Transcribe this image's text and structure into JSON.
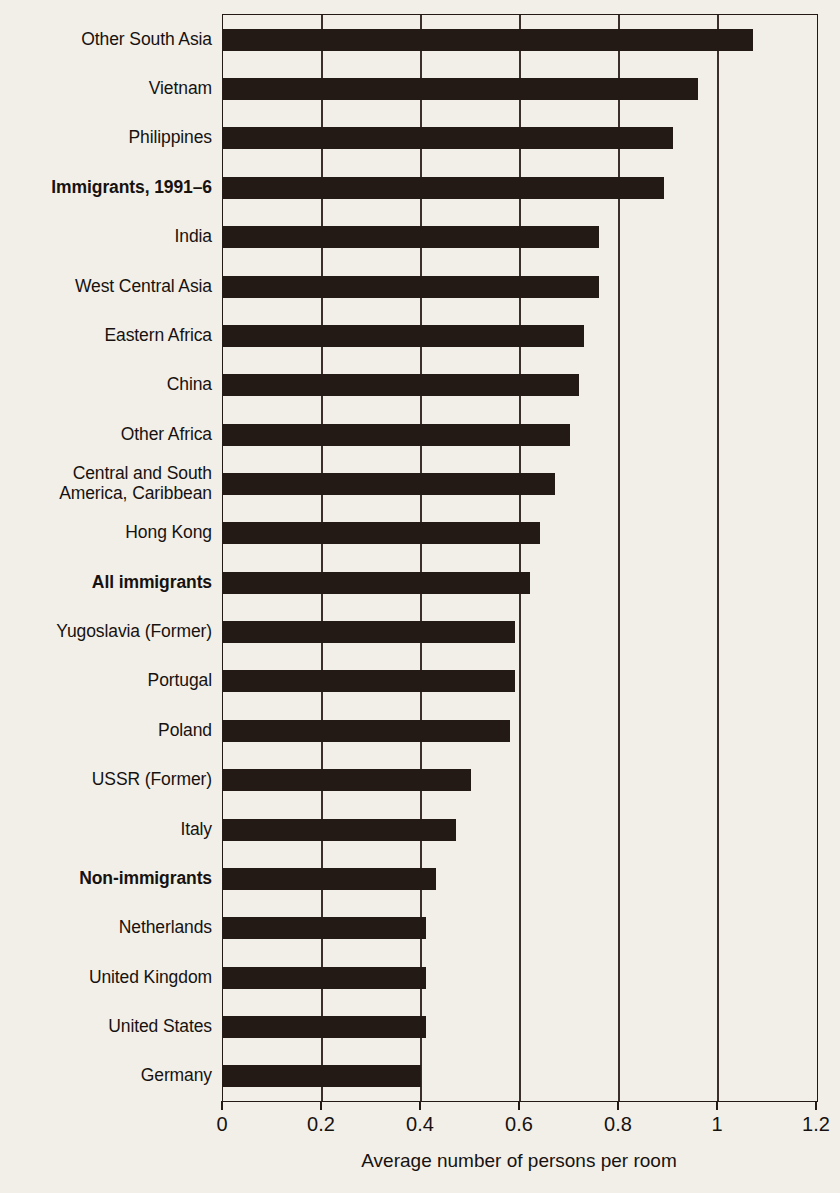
{
  "chart_data": {
    "type": "bar",
    "orientation": "horizontal",
    "title": "",
    "xlabel": "Average number of persons per room",
    "ylabel": "",
    "xlim": [
      0,
      1.2
    ],
    "xticks": [
      "0",
      "0.2",
      "0.4",
      "0.6",
      "0.8",
      "1",
      "1.2"
    ],
    "xtick_values": [
      0,
      0.2,
      0.4,
      0.6,
      0.8,
      1.0,
      1.2
    ],
    "grid": true,
    "legend": "none",
    "bar_color": "#231a16",
    "background_color": "#f2efe9",
    "categories": [
      "Other South Asia",
      "Vietnam",
      "Philippines",
      "Immigrants, 1991–6",
      "India",
      "West Central Asia",
      "Eastern Africa",
      "China",
      "Other Africa",
      "Central and South\nAmerica, Caribbean",
      "Hong Kong",
      "All immigrants",
      "Yugoslavia (Former)",
      "Portugal",
      "Poland",
      "USSR (Former)",
      "Italy",
      "Non-immigrants",
      "Netherlands",
      "United Kingdom",
      "United States",
      "Germany"
    ],
    "values": [
      1.07,
      0.96,
      0.91,
      0.89,
      0.76,
      0.76,
      0.73,
      0.72,
      0.7,
      0.67,
      0.64,
      0.62,
      0.59,
      0.59,
      0.58,
      0.5,
      0.47,
      0.43,
      0.41,
      0.41,
      0.41,
      0.4
    ],
    "emphasized": [
      "Immigrants, 1991–6",
      "All immigrants",
      "Non-immigrants"
    ]
  }
}
